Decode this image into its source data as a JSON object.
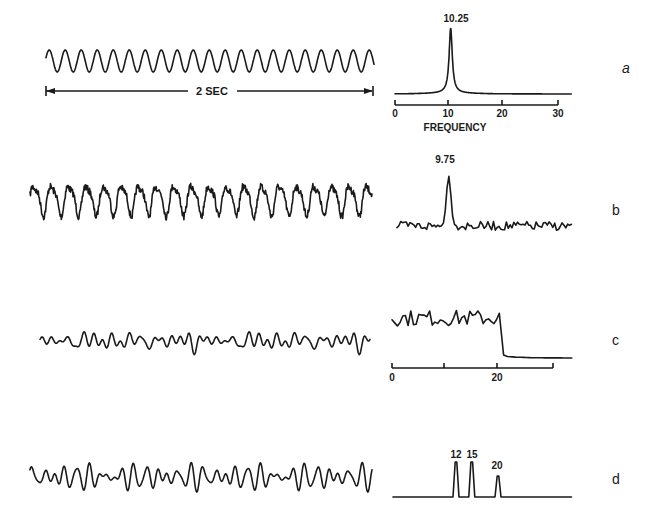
{
  "figure": {
    "panels": [
      {
        "id": "a",
        "letter": "a",
        "time_label": "2 SEC",
        "peak_label": "10.25",
        "axis_ticks": [
          "0",
          "10",
          "20",
          "30"
        ],
        "axis_title": "FREQUENCY"
      },
      {
        "id": "b",
        "letter": "b",
        "peak_label": "9.75"
      },
      {
        "id": "c",
        "letter": "c",
        "axis_ticks": [
          "0",
          "",
          "20",
          ""
        ]
      },
      {
        "id": "d",
        "letter": "d",
        "peak_labels": [
          "12",
          "15",
          "20"
        ]
      }
    ]
  },
  "chart_data": [
    {
      "type": "line",
      "panel": "a",
      "title": "Sinusoid (2 sec) and its power spectrum",
      "time_series": {
        "description": "pure sine wave, ~20.5 cycles over 2 sec",
        "duration_sec": 2,
        "frequency_hz": 10.25
      },
      "spectrum": {
        "xlabel": "FREQUENCY",
        "xlim": [
          0,
          32
        ],
        "xticks": [
          0,
          10,
          20,
          30
        ],
        "peaks": [
          {
            "freq": 10.25,
            "label": "10.25",
            "shape": "single sharp peak"
          }
        ]
      }
    },
    {
      "type": "line",
      "panel": "b",
      "title": "Noisy rhythmic signal and its spectrum",
      "time_series": {
        "description": "irregular waveform with dominant ~10 Hz rhythm plus noise"
      },
      "spectrum": {
        "xlim": [
          0,
          32
        ],
        "peaks": [
          {
            "freq": 9.75,
            "label": "9.75",
            "shape": "single dominant peak above noise floor"
          }
        ]
      }
    },
    {
      "type": "line",
      "panel": "c",
      "title": "Low-amplitude broadband signal and its spectrum",
      "time_series": {
        "description": "low-amplitude irregular wave"
      },
      "spectrum": {
        "xlim": [
          0,
          32
        ],
        "xticks": [
          0,
          10,
          20,
          30
        ],
        "xtick_labels": [
          "0",
          "",
          "20",
          ""
        ],
        "description": "broadband noise 0-20, sharp drop-off at 20, flat beyond"
      }
    },
    {
      "type": "line",
      "panel": "d",
      "title": "Sum of three sinusoids and its spectrum",
      "time_series": {
        "description": "beating waveform composed of 12, 15, 20 Hz components"
      },
      "spectrum": {
        "xlim": [
          0,
          32
        ],
        "peaks": [
          {
            "freq": 12,
            "label": "12",
            "rel_height": 1.0
          },
          {
            "freq": 15,
            "label": "15",
            "rel_height": 1.0
          },
          {
            "freq": 20,
            "label": "20",
            "rel_height": 0.6
          }
        ]
      }
    }
  ]
}
